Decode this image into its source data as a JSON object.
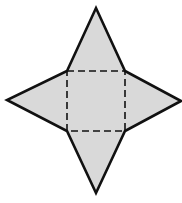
{
  "diagram": {
    "type": "square-pyramid-net",
    "colors": {
      "fill": "#d9d9d9",
      "stroke": "#111111",
      "background": "#ffffff"
    },
    "base_square": {
      "top_left": [
        67,
        71
      ],
      "top_right": [
        125,
        71
      ],
      "bottom_right": [
        125,
        131
      ],
      "bottom_left": [
        67,
        131
      ],
      "edge_style": "dashed"
    },
    "triangles": [
      {
        "name": "top",
        "apex": [
          96,
          8
        ]
      },
      {
        "name": "right",
        "apex": [
          181,
          101
        ]
      },
      {
        "name": "bottom",
        "apex": [
          96,
          193
        ]
      },
      {
        "name": "left",
        "apex": [
          7,
          100
        ]
      }
    ],
    "outline_points": [
      [
        67,
        71
      ],
      [
        96,
        8
      ],
      [
        125,
        71
      ],
      [
        181,
        101
      ],
      [
        125,
        131
      ],
      [
        96,
        193
      ],
      [
        67,
        131
      ],
      [
        7,
        100
      ]
    ]
  }
}
